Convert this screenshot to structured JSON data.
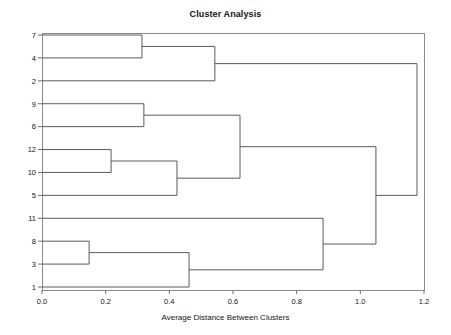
{
  "chart_data": {
    "type": "dendrogram",
    "title": "Cluster Analysis",
    "xlabel": "Average Distance Between Clusters",
    "ylabel": "",
    "xlim": [
      0.0,
      1.2
    ],
    "xticks": [
      0.0,
      0.2,
      0.4,
      0.6,
      0.8,
      1.0,
      1.2
    ],
    "xtick_labels": [
      "0.0",
      "0.2",
      "0.4",
      "0.6",
      "0.8",
      "1.0",
      "1.2"
    ],
    "grid": false,
    "legend": null,
    "leaf_order": [
      "7",
      "4",
      "2",
      "9",
      "6",
      "12",
      "10",
      "5",
      "11",
      "8",
      "3",
      "1"
    ],
    "leaf_labels": [
      "7",
      "4",
      "2",
      "9",
      "6",
      "12",
      "10",
      "5",
      "11",
      "8",
      "3",
      "1"
    ],
    "orientation": "left-to-right",
    "merges": [
      {
        "id": "m1",
        "left": "7",
        "right": "4",
        "distance": 0.314
      },
      {
        "id": "m2",
        "left": "m1",
        "right": "2",
        "distance": 0.543
      },
      {
        "id": "m3",
        "left": "9",
        "right": "6",
        "distance": 0.32
      },
      {
        "id": "m4",
        "left": "12",
        "right": "10",
        "distance": 0.217
      },
      {
        "id": "m5",
        "left": "m4",
        "right": "5",
        "distance": 0.424
      },
      {
        "id": "m6",
        "left": "m3",
        "right": "m5",
        "distance": 0.622
      },
      {
        "id": "m7",
        "left": "8",
        "right": "3",
        "distance": 0.148
      },
      {
        "id": "m8",
        "left": "m7",
        "right": "1",
        "distance": 0.462
      },
      {
        "id": "m9",
        "left": "11",
        "right": "m8",
        "distance": 0.883
      },
      {
        "id": "m10",
        "left": "m6",
        "right": "m9",
        "distance": 1.049
      },
      {
        "id": "m11",
        "left": "m2",
        "right": "m10",
        "distance": 1.178
      }
    ],
    "colors": {
      "link": "#5a5a5a",
      "frame": "#8a8a8a",
      "text": "#141414",
      "background": "#ffffff"
    },
    "plot_area": {
      "left": 42,
      "right": 424,
      "top": 33,
      "bottom": 290
    }
  }
}
